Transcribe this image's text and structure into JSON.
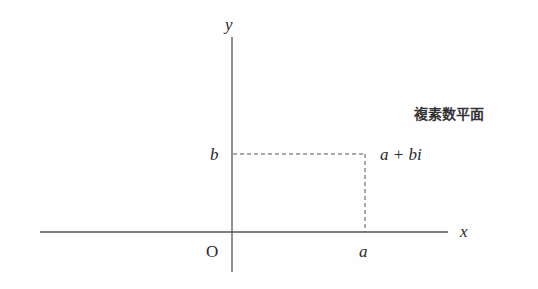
{
  "diagram": {
    "title": "複素数平面",
    "axes": {
      "x_label": "x",
      "y_label": "y",
      "origin_label": "O"
    },
    "point": {
      "label": "a + bi",
      "real_part_label": "a",
      "imag_part_label": "b"
    },
    "colors": {
      "background": "#fefefe",
      "axis": "#555555",
      "dashed": "#555555",
      "text": "#2a2a2a"
    }
  }
}
